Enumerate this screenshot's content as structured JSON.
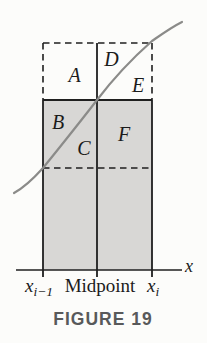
{
  "figure": {
    "caption": "FIGURE 19",
    "labels": {
      "region_a": "A",
      "region_b": "B",
      "region_c": "C",
      "region_d": "D",
      "region_e": "E",
      "region_f": "F"
    },
    "axis": {
      "x_label": "x",
      "left_tick": {
        "base": "x",
        "sub": "i−1"
      },
      "mid_tick": "Midpoint",
      "right_tick": {
        "base": "x",
        "sub": "i"
      }
    },
    "colors": {
      "shaded_region": "#d8d7d5",
      "curve": "#8b8b89",
      "line_ink": "#1f1f1f",
      "caption": "#58595a",
      "background": "#fcfcfa"
    }
  }
}
